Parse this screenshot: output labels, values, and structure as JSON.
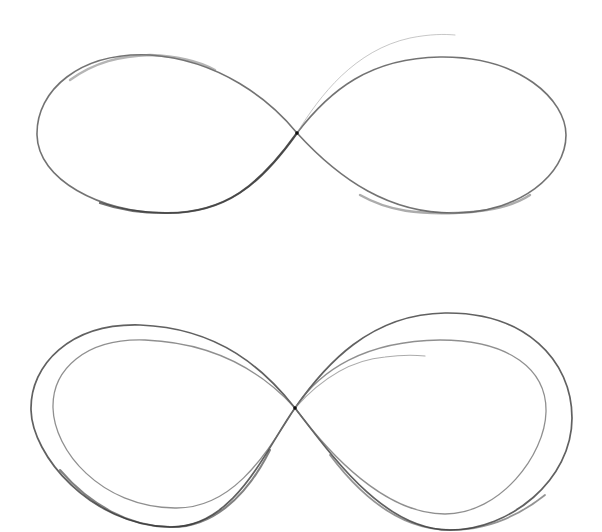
{
  "image": {
    "description": "Pencil sketch of two infinity symbols on white paper",
    "background": "#ffffff",
    "stroke_color": "#3a3a3a",
    "figures": [
      {
        "name": "single-infinity",
        "strokes": 2,
        "position": "top"
      },
      {
        "name": "double-infinity",
        "strokes": 4,
        "position": "bottom"
      }
    ]
  }
}
